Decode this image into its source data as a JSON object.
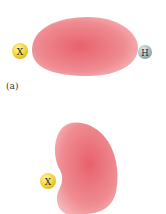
{
  "panel_a": {
    "label": "(a)",
    "atom_left": {
      "symbol": "X",
      "color": "#f2d430"
    },
    "atom_right": {
      "symbol": "H",
      "color": "#9fb6c0"
    },
    "cloud_color": "#ec7d85"
  },
  "panel_b": {
    "atom": {
      "symbol": "X",
      "color": "#f2d430"
    },
    "cloud_color": "#ec7d85"
  }
}
